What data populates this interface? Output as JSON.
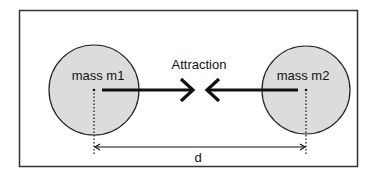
{
  "diagram": {
    "colors": {
      "frame": "#333333",
      "mass_fill": "#dcdcdc",
      "mass_stroke": "#222222",
      "arrow": "#111111",
      "background": "#ffffff"
    },
    "masses": [
      {
        "label": "mass m1"
      },
      {
        "label": "mass m2"
      }
    ],
    "force_label": "Attraction",
    "distance_label": "d"
  }
}
